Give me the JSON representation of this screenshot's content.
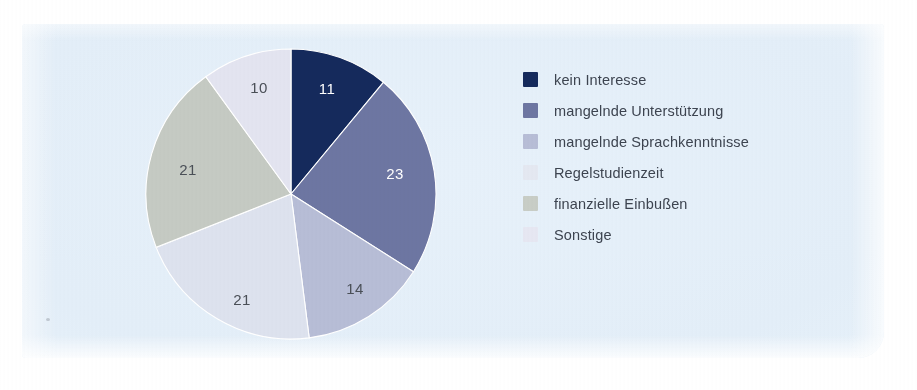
{
  "figure": {
    "panel_background": "#e5effa",
    "page_background": "#ffffff"
  },
  "chart_data": {
    "type": "pie",
    "title": "",
    "subtitle": "",
    "xlabel": "",
    "ylabel": "",
    "legend_position": "right",
    "grid": false,
    "total": 100,
    "units": "percent",
    "start_angle_deg": 0,
    "direction": "clockwise",
    "categories": [
      "kein Interesse",
      "mangelnde Unterstützung",
      "mangelnde Sprachkenntnisse",
      "Regelstudienzeit",
      "finanzielle Einbußen",
      "Sonstige"
    ],
    "values": [
      11,
      23,
      14,
      21,
      21,
      10
    ],
    "colors": [
      "#152a5c",
      "#6d76a2",
      "#b7bdd6",
      "#dde2ee",
      "#c5cac3",
      "#e3e4f0"
    ],
    "slices": [
      {
        "label": "kein Interesse",
        "value": 11,
        "value_text": "11",
        "color": "#152a5c",
        "label_color": "light",
        "label_x": 36,
        "label_y": -104
      },
      {
        "label": "mangelnde Unterstützung",
        "value": 23,
        "value_text": "23",
        "color": "#6d76a2",
        "label_color": "light",
        "label_y": -19,
        "label_x": 104
      },
      {
        "label": "mangelnde Sprachkenntnisse",
        "value": 14,
        "value_text": "14",
        "color": "#b7bdd6",
        "label_color": "dark",
        "label_x": 64,
        "label_y": 96
      },
      {
        "label": "Regelstudienzeit",
        "value": 21,
        "value_text": "21",
        "color": "#dde2ee",
        "label_color": "dark",
        "label_x": -49,
        "label_y": 107
      },
      {
        "label": "finanzielle Einbußen",
        "value": 21,
        "value_text": "21",
        "color": "#c5cac3",
        "label_color": "dark",
        "label_x": -103,
        "label_y": -23
      },
      {
        "label": "Sonstige",
        "value": 10,
        "value_text": "10",
        "color": "#e3e4f0",
        "label_color": "dark",
        "label_x": -32,
        "label_y": -105
      }
    ]
  },
  "legend": {
    "items": [
      {
        "label": "kein Interesse",
        "color": "#152a5c"
      },
      {
        "label": "mangelnde Unterstützung",
        "color": "#6d76a2"
      },
      {
        "label": "mangelnde Sprachkenntnisse",
        "color": "#b7bdd6"
      },
      {
        "label": "Regelstudienzeit",
        "color": "#e4e8f1"
      },
      {
        "label": "finanzielle Einbußen",
        "color": "#c8cdc6"
      },
      {
        "label": "Sonstige",
        "color": "#e6e7f2"
      }
    ]
  }
}
